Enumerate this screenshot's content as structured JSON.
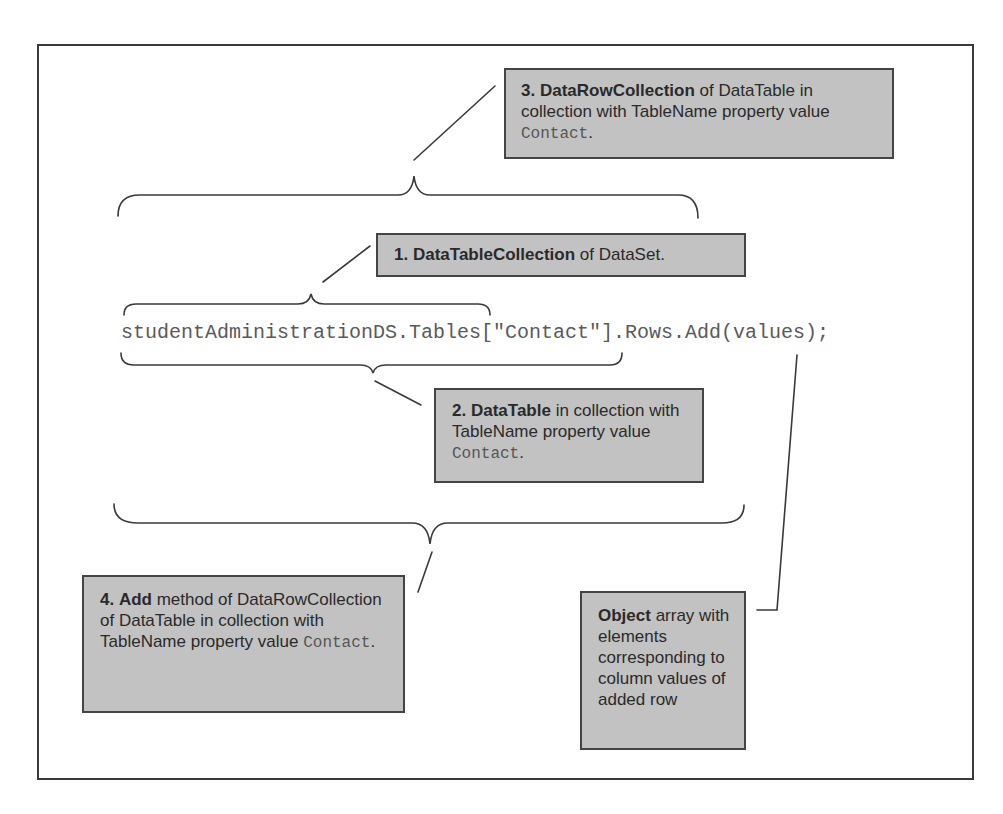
{
  "code_line": "studentAdministrationDS.Tables[\"Contact\"].Rows.Add(values);",
  "callouts": {
    "box3": {
      "number": "3.",
      "bold": "DataRowCollection",
      "text": " of DataTable in collection with TableName property value ",
      "code": "Contact",
      "end": "."
    },
    "box1": {
      "number": "1.",
      "bold": "DataTableCollection",
      "text": " of DataSet."
    },
    "box2": {
      "number": "2.",
      "bold": "DataTable",
      "text": " in collection with TableName property value ",
      "code": "Contact",
      "end": "."
    },
    "box4": {
      "number": "4.",
      "bold": "Add",
      "text": " method of DataRowCollection of DataTable in collection with TableName property value ",
      "code": "Contact",
      "end": "."
    },
    "box5": {
      "bold": "Object",
      "text": " array with elements corresponding to column values of added row"
    }
  },
  "colors": {
    "callout_fill": "#c2c2c2",
    "callout_border": "#444444",
    "line": "#3a3a3a",
    "code_text": "#5a5a5a"
  }
}
